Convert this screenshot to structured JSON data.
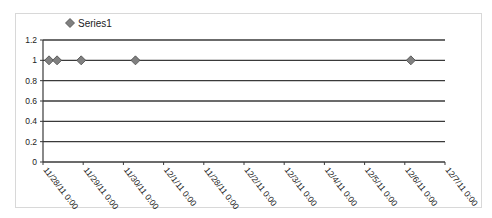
{
  "chart_data": {
    "type": "scatter",
    "title": "",
    "xlabel": "",
    "ylabel": "",
    "legend": {
      "position": "top-left",
      "entries": [
        "Series1"
      ]
    },
    "grid": {
      "y_major": true,
      "x_major": false
    },
    "ylim": [
      0,
      1.2
    ],
    "y_ticks": [
      "0",
      "0.2",
      "0.4",
      "0.6",
      "0.8",
      "1",
      "1.2"
    ],
    "x_tick_labels": [
      "11/28/11 0:00",
      "11/29/11 0:00",
      "11/30/11 0:00",
      "12/1/11 0:00",
      "11/28/11 0:00",
      "12/2/11 0:00",
      "12/3/11 0:00",
      "12/4/11 0:00",
      "12/5/11 0:00",
      "12/6/11 0:00",
      "12/7/11 0:00"
    ],
    "series": [
      {
        "name": "Series1",
        "marker": "diamond",
        "color": "#808080",
        "points": [
          {
            "x_tick_pos": 0.15,
            "y": 1
          },
          {
            "x_tick_pos": 0.35,
            "y": 1
          },
          {
            "x_tick_pos": 0.95,
            "y": 1
          },
          {
            "x_tick_pos": 2.3,
            "y": 1
          },
          {
            "x_tick_pos": 9.15,
            "y": 1
          }
        ]
      }
    ]
  }
}
